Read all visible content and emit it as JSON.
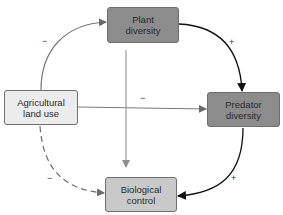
{
  "nodes": {
    "plant": {
      "line1": "Plant",
      "line2": "diversity",
      "color": "#8c8c8c"
    },
    "agri": {
      "line1": "Agricultural",
      "line2": "land use",
      "color": "#ececec"
    },
    "predator": {
      "line1": "Predator",
      "line2": "diversity",
      "color": "#8c8c8c"
    },
    "bio": {
      "line1": "Biological",
      "line2": "control",
      "color": "#c9c9c9"
    }
  },
  "edges": [
    {
      "from": "Agricultural land use",
      "to": "Plant diversity",
      "sign": "−",
      "style": "solid-gray"
    },
    {
      "from": "Plant diversity",
      "to": "Predator diversity",
      "sign": "+",
      "style": "solid-black"
    },
    {
      "from": "Agricultural land use",
      "to": "Predator diversity",
      "sign": "−",
      "style": "solid-gray"
    },
    {
      "from": "Plant diversity",
      "to": "Biological control",
      "sign": "",
      "style": "solid-lightgray"
    },
    {
      "from": "Predator diversity",
      "to": "Biological control",
      "sign": "+",
      "style": "solid-black"
    },
    {
      "from": "Agricultural land use",
      "to": "Biological control",
      "sign": "−",
      "style": "dashed-gray"
    }
  ],
  "signs": {
    "agri_plant": "−",
    "plant_pred": "+",
    "agri_pred": "−",
    "pred_bio": "+",
    "agri_bio": "−"
  }
}
